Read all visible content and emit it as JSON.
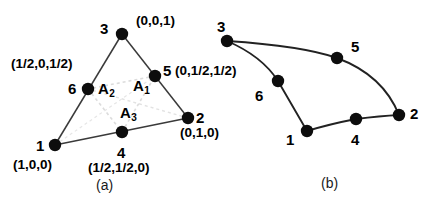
{
  "figure": {
    "background_color": "#ffffff",
    "ink_color": "#000000",
    "node_fill_color": "#0d0d0d",
    "edge_color": "#3a3a3a",
    "guide_color": "#d8d8d8",
    "subfigures": [
      {
        "key": "a",
        "caption": "(a)"
      },
      {
        "key": "b",
        "caption": "(b)"
      }
    ]
  },
  "panel_a": {
    "caption": "(a)",
    "nodes": [
      {
        "id": "n1",
        "number": "1",
        "coord": "(1,0,0)",
        "x": 55,
        "y": 145
      },
      {
        "id": "n2",
        "number": "2",
        "coord": "(0,1,0)",
        "x": 188,
        "y": 118
      },
      {
        "id": "n3",
        "number": "3",
        "coord": "(0,0,1)",
        "x": 122,
        "y": 34
      },
      {
        "id": "n4",
        "number": "4",
        "coord": "(1/2,1/2,0)",
        "x": 122,
        "y": 132
      },
      {
        "id": "n5",
        "number": "5",
        "coord": "(0,1/2,1/2)",
        "x": 155,
        "y": 76
      },
      {
        "id": "n6",
        "number": "6",
        "coord": "(1/2,0,1/2)",
        "x": 88,
        "y": 89
      }
    ],
    "areas": [
      {
        "id": "A1",
        "base": "A",
        "sub": "1",
        "x": 142,
        "y": 86
      },
      {
        "id": "A2",
        "base": "A",
        "sub": "2",
        "x": 108,
        "y": 89
      },
      {
        "id": "A3",
        "base": "A",
        "sub": "3",
        "x": 128,
        "y": 113
      }
    ],
    "edges": [
      {
        "from": "n1",
        "to": "n2"
      },
      {
        "from": "n2",
        "to": "n3"
      },
      {
        "from": "n3",
        "to": "n1"
      }
    ],
    "guides": [
      {
        "from": "n6",
        "to": "n4"
      },
      {
        "from": "n4",
        "to": "n5"
      },
      {
        "from": "n5",
        "to": "n6"
      }
    ]
  },
  "panel_b": {
    "caption": "(b)",
    "nodes": [
      {
        "id": "n1",
        "number": "1",
        "x": 307,
        "y": 131
      },
      {
        "id": "n2",
        "number": "2",
        "x": 399,
        "y": 115
      },
      {
        "id": "n3",
        "number": "3",
        "x": 227,
        "y": 41
      },
      {
        "id": "n4",
        "number": "4",
        "x": 356,
        "y": 119
      },
      {
        "id": "n5",
        "number": "5",
        "x": 337,
        "y": 58
      },
      {
        "id": "n6",
        "number": "6",
        "x": 278,
        "y": 81
      }
    ],
    "edges": [
      {
        "from": "n1",
        "mid": "n4",
        "to": "n2"
      },
      {
        "from": "n2",
        "mid": "n5",
        "to": "n3"
      },
      {
        "from": "n3",
        "mid": "n6",
        "to": "n1"
      }
    ]
  },
  "labels_panel_a": {
    "num_1": "1",
    "num_2": "2",
    "num_3": "3",
    "num_4": "4",
    "num_5": "5",
    "num_6": "6",
    "coord_1": "(1,0,0)",
    "coord_2": "(0,1,0)",
    "coord_3": "(0,0,1)",
    "coord_4": "(1/2,1/2,0)",
    "coord_5": "(0,1/2,1/2)",
    "coord_6": "(1/2,0,1/2)",
    "area_1": "A",
    "area_1_sub": "1",
    "area_2": "A",
    "area_2_sub": "2",
    "area_3": "A",
    "area_3_sub": "3",
    "caption": "(a)"
  },
  "labels_panel_b": {
    "num_1": "1",
    "num_2": "2",
    "num_3": "3",
    "num_4": "4",
    "num_5": "5",
    "num_6": "6",
    "caption": "(b)"
  }
}
